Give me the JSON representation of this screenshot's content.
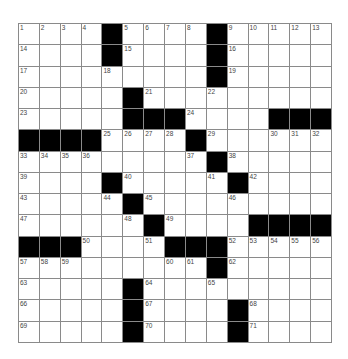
{
  "puzzle": {
    "rows": 15,
    "cols": 15,
    "colors": {
      "block": "#000000",
      "cell": "#ffffff",
      "grid_line": "#8a8a8a",
      "number": "#444444"
    },
    "layout": [
      "....#....#.....",
      "....#....#.....",
      ".........#.....",
      ".....#.........",
      ".....###....###",
      "####....#......",
      ".........#.....",
      "....#.....#....",
      ".....#.........",
      "......#....####",
      "###....###.....",
      ".........#.....",
      ".....#.........",
      ".....#....#....",
      ".....#....#...."
    ],
    "numbers": [
      {
        "r": 0,
        "c": 0,
        "n": "1"
      },
      {
        "r": 0,
        "c": 1,
        "n": "2"
      },
      {
        "r": 0,
        "c": 2,
        "n": "3"
      },
      {
        "r": 0,
        "c": 3,
        "n": "4"
      },
      {
        "r": 0,
        "c": 5,
        "n": "5"
      },
      {
        "r": 0,
        "c": 6,
        "n": "6"
      },
      {
        "r": 0,
        "c": 7,
        "n": "7"
      },
      {
        "r": 0,
        "c": 8,
        "n": "8"
      },
      {
        "r": 0,
        "c": 10,
        "n": "9"
      },
      {
        "r": 0,
        "c": 11,
        "n": "10"
      },
      {
        "r": 0,
        "c": 12,
        "n": "11"
      },
      {
        "r": 0,
        "c": 13,
        "n": "12"
      },
      {
        "r": 0,
        "c": 14,
        "n": "13"
      },
      {
        "r": 1,
        "c": 0,
        "n": "14"
      },
      {
        "r": 1,
        "c": 5,
        "n": "15"
      },
      {
        "r": 1,
        "c": 10,
        "n": "16"
      },
      {
        "r": 2,
        "c": 0,
        "n": "17"
      },
      {
        "r": 2,
        "c": 4,
        "n": "18"
      },
      {
        "r": 2,
        "c": 10,
        "n": "19"
      },
      {
        "r": 3,
        "c": 0,
        "n": "20"
      },
      {
        "r": 3,
        "c": 6,
        "n": "21"
      },
      {
        "r": 3,
        "c": 9,
        "n": "22"
      },
      {
        "r": 4,
        "c": 0,
        "n": "23"
      },
      {
        "r": 4,
        "c": 8,
        "n": "24"
      },
      {
        "r": 5,
        "c": 4,
        "n": "25"
      },
      {
        "r": 5,
        "c": 5,
        "n": "26"
      },
      {
        "r": 5,
        "c": 6,
        "n": "27"
      },
      {
        "r": 5,
        "c": 7,
        "n": "28"
      },
      {
        "r": 5,
        "c": 9,
        "n": "29"
      },
      {
        "r": 5,
        "c": 12,
        "n": "30"
      },
      {
        "r": 5,
        "c": 13,
        "n": "31"
      },
      {
        "r": 5,
        "c": 14,
        "n": "32"
      },
      {
        "r": 6,
        "c": 0,
        "n": "33"
      },
      {
        "r": 6,
        "c": 1,
        "n": "34"
      },
      {
        "r": 6,
        "c": 2,
        "n": "35"
      },
      {
        "r": 6,
        "c": 3,
        "n": "36"
      },
      {
        "r": 6,
        "c": 8,
        "n": "37"
      },
      {
        "r": 6,
        "c": 10,
        "n": "38"
      },
      {
        "r": 7,
        "c": 0,
        "n": "39"
      },
      {
        "r": 7,
        "c": 5,
        "n": "40"
      },
      {
        "r": 7,
        "c": 9,
        "n": "41"
      },
      {
        "r": 7,
        "c": 11,
        "n": "42"
      },
      {
        "r": 8,
        "c": 0,
        "n": "43"
      },
      {
        "r": 8,
        "c": 4,
        "n": "44"
      },
      {
        "r": 8,
        "c": 6,
        "n": "45"
      },
      {
        "r": 8,
        "c": 10,
        "n": "46"
      },
      {
        "r": 9,
        "c": 0,
        "n": "47"
      },
      {
        "r": 9,
        "c": 5,
        "n": "48"
      },
      {
        "r": 9,
        "c": 7,
        "n": "49"
      },
      {
        "r": 10,
        "c": 3,
        "n": "50"
      },
      {
        "r": 10,
        "c": 6,
        "n": "51"
      },
      {
        "r": 10,
        "c": 10,
        "n": "52"
      },
      {
        "r": 10,
        "c": 11,
        "n": "53"
      },
      {
        "r": 10,
        "c": 12,
        "n": "54"
      },
      {
        "r": 10,
        "c": 13,
        "n": "55"
      },
      {
        "r": 10,
        "c": 14,
        "n": "56"
      },
      {
        "r": 11,
        "c": 0,
        "n": "57"
      },
      {
        "r": 11,
        "c": 1,
        "n": "58"
      },
      {
        "r": 11,
        "c": 2,
        "n": "59"
      },
      {
        "r": 11,
        "c": 7,
        "n": "60"
      },
      {
        "r": 11,
        "c": 8,
        "n": "61"
      },
      {
        "r": 11,
        "c": 10,
        "n": "62"
      },
      {
        "r": 12,
        "c": 0,
        "n": "63"
      },
      {
        "r": 12,
        "c": 6,
        "n": "64"
      },
      {
        "r": 12,
        "c": 9,
        "n": "65"
      },
      {
        "r": 13,
        "c": 0,
        "n": "66"
      },
      {
        "r": 13,
        "c": 6,
        "n": "67"
      },
      {
        "r": 13,
        "c": 11,
        "n": "68"
      },
      {
        "r": 14,
        "c": 0,
        "n": "69"
      },
      {
        "r": 14,
        "c": 6,
        "n": "70"
      },
      {
        "r": 14,
        "c": 11,
        "n": "71"
      }
    ]
  }
}
